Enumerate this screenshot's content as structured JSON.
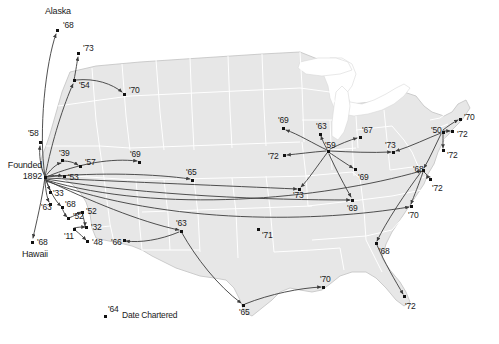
{
  "figure": {
    "type": "map-diagram",
    "title": "",
    "legend": {
      "sample_year": "'64",
      "text": "Date Chartered"
    },
    "origin": {
      "line1": "Founded",
      "line2": "1892"
    },
    "place_labels": [
      {
        "name": "alaska",
        "text": "Alaska"
      },
      {
        "name": "hawaii",
        "text": "Hawaii"
      }
    ],
    "colors": {
      "land": "#e7e7e7",
      "land_stroke": "#ffffff",
      "state_border": "#c9c9c9",
      "outline": "#bdbdbd",
      "arc": "#3c3c3c",
      "dot": "#111111",
      "text": "#1a1a1a",
      "background": "#ffffff"
    },
    "nodes": [
      {
        "id": "alaska",
        "year": "'68",
        "x": 57,
        "y": 30,
        "label_dx": 6,
        "label_dy": -9
      },
      {
        "id": "n73nw",
        "year": "'73",
        "x": 78,
        "y": 53,
        "label_dx": 5,
        "label_dy": -9
      },
      {
        "id": "n54",
        "year": "'54",
        "x": 74,
        "y": 80,
        "label_dx": 5,
        "label_dy": 1
      },
      {
        "id": "n70id",
        "year": "'70",
        "x": 124,
        "y": 94,
        "label_dx": 5,
        "label_dy": -8
      },
      {
        "id": "n58",
        "year": "'58",
        "x": 40,
        "y": 142,
        "label_dx": -12,
        "label_dy": -13
      },
      {
        "id": "n39",
        "year": "'39",
        "x": 62,
        "y": 160,
        "label_dx": -3,
        "label_dy": -11
      },
      {
        "id": "n57",
        "year": "'57",
        "x": 80,
        "y": 166,
        "label_dx": 5,
        "label_dy": -8
      },
      {
        "id": "hub",
        "year": "",
        "x": 45,
        "y": 177,
        "label_dx": 0,
        "label_dy": 0
      },
      {
        "id": "n53",
        "year": "'53",
        "x": 64,
        "y": 176,
        "label_dx": 4,
        "label_dy": -3
      },
      {
        "id": "n33",
        "year": "'33",
        "x": 50,
        "y": 192,
        "label_dx": 3,
        "label_dy": -3
      },
      {
        "id": "n63ca",
        "year": "'63",
        "x": 50,
        "y": 204,
        "label_dx": -9,
        "label_dy": -1
      },
      {
        "id": "n68ca",
        "year": "'68",
        "x": 62,
        "y": 207,
        "label_dx": 3,
        "label_dy": -7
      },
      {
        "id": "n52",
        "year": "'52",
        "x": 68,
        "y": 218,
        "label_dx": 5,
        "label_dy": -6
      },
      {
        "id": "n52b",
        "year": "'52",
        "x": 82,
        "y": 212,
        "label_dx": 4,
        "label_dy": -5
      },
      {
        "id": "n32",
        "year": "'32",
        "x": 86,
        "y": 227,
        "label_dx": 5,
        "label_dy": -4
      },
      {
        "id": "n11",
        "year": "'11",
        "x": 74,
        "y": 229,
        "label_dx": -10,
        "label_dy": 3
      },
      {
        "id": "n48",
        "year": "'48",
        "x": 87,
        "y": 241,
        "label_dx": 5,
        "label_dy": -3
      },
      {
        "id": "n68hi",
        "year": "'68",
        "x": 32,
        "y": 242,
        "label_dx": 5,
        "label_dy": -4
      },
      {
        "id": "n69nm",
        "year": "'69",
        "x": 139,
        "y": 162,
        "label_dx": -9,
        "label_dy": -12
      },
      {
        "id": "n65ks",
        "year": "'65",
        "x": 192,
        "y": 180,
        "label_dx": -6,
        "label_dy": -12
      },
      {
        "id": "n66az",
        "year": "'66",
        "x": 124,
        "y": 240,
        "label_dx": -13,
        "label_dy": -2
      },
      {
        "id": "n63tx",
        "year": "'63",
        "x": 181,
        "y": 231,
        "label_dx": -5,
        "label_dy": -12
      },
      {
        "id": "n71ok",
        "year": "'71",
        "x": 258,
        "y": 229,
        "label_dx": 4,
        "label_dy": 2
      },
      {
        "id": "n65tx",
        "year": "'65",
        "x": 243,
        "y": 305,
        "label_dx": -4,
        "label_dy": 3
      },
      {
        "id": "n70la",
        "year": "'70",
        "x": 323,
        "y": 287,
        "label_dx": -3,
        "label_dy": -12
      },
      {
        "id": "n69mn",
        "year": "'69",
        "x": 283,
        "y": 128,
        "label_dx": -5,
        "label_dy": -12
      },
      {
        "id": "n72ne",
        "year": "'72",
        "x": 284,
        "y": 155,
        "label_dx": -16,
        "label_dy": -3
      },
      {
        "id": "n63wi",
        "year": "'63",
        "x": 320,
        "y": 134,
        "label_dx": -4,
        "label_dy": -12
      },
      {
        "id": "hub2",
        "year": "'59",
        "x": 328,
        "y": 151,
        "label_dx": -3,
        "label_dy": -10
      },
      {
        "id": "n67mi",
        "year": "'67",
        "x": 360,
        "y": 137,
        "label_dx": 2,
        "label_dy": -11
      },
      {
        "id": "n69il",
        "year": "'69",
        "x": 355,
        "y": 169,
        "label_dx": 3,
        "label_dy": 4
      },
      {
        "id": "n73ks",
        "year": "'73",
        "x": 299,
        "y": 189,
        "label_dx": -6,
        "label_dy": 2
      },
      {
        "id": "n69mo",
        "year": "'69",
        "x": 352,
        "y": 200,
        "label_dx": -5,
        "label_dy": 4
      },
      {
        "id": "n73oh",
        "year": "'73",
        "x": 393,
        "y": 152,
        "label_dx": -8,
        "label_dy": -11
      },
      {
        "id": "hub3",
        "year": "'50",
        "x": 443,
        "y": 132,
        "label_dx": -12,
        "label_dy": -6
      },
      {
        "id": "n70ne",
        "year": "'70",
        "x": 460,
        "y": 119,
        "label_dx": 4,
        "label_dy": -6
      },
      {
        "id": "n72ny",
        "year": "'72",
        "x": 452,
        "y": 131,
        "label_dx": 5,
        "label_dy": -1
      },
      {
        "id": "n72nj",
        "year": "'72",
        "x": 443,
        "y": 150,
        "label_dx": 4,
        "label_dy": 1
      },
      {
        "id": "n68pa",
        "year": "'68",
        "x": 423,
        "y": 170,
        "label_dx": -10,
        "label_dy": -5
      },
      {
        "id": "n72md",
        "year": "'72",
        "x": 430,
        "y": 179,
        "label_dx": 2,
        "label_dy": 5
      },
      {
        "id": "n70va",
        "year": "'70",
        "x": 411,
        "y": 206,
        "label_dx": -3,
        "label_dy": 5
      },
      {
        "id": "n68ga",
        "year": "'68",
        "x": 376,
        "y": 243,
        "label_dx": 3,
        "label_dy": 4
      },
      {
        "id": "n72fl",
        "year": "'72",
        "x": 404,
        "y": 296,
        "label_dx": 1,
        "label_dy": 6
      }
    ]
  }
}
